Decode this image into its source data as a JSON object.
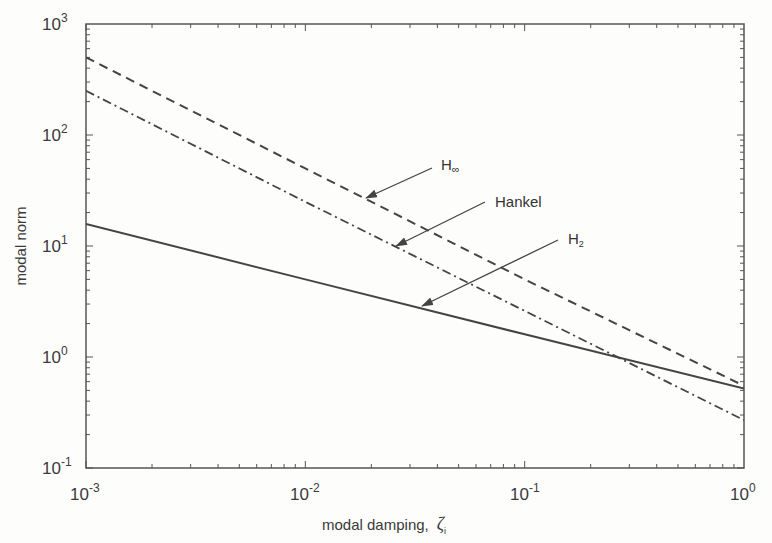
{
  "chart_data": {
    "type": "line",
    "title": "",
    "xlabel": "modal damping, ζ_i",
    "ylabel": "modal norm",
    "xscale": "log",
    "yscale": "log",
    "xlim": [
      0.001,
      1
    ],
    "ylim": [
      0.1,
      1000
    ],
    "grid": false,
    "x_ticks": [
      "10^-3",
      "10^-2",
      "10^-1",
      "10^0"
    ],
    "y_ticks": [
      "10^-1",
      "10^0",
      "10^1",
      "10^2",
      "10^3"
    ],
    "series": [
      {
        "name": "H∞",
        "style": "dashed",
        "x": [
          0.001,
          0.01,
          0.1,
          1
        ],
        "values": [
          500,
          50,
          5,
          0.55
        ]
      },
      {
        "name": "Hankel",
        "style": "dash-dot",
        "x": [
          0.001,
          0.01,
          0.1,
          1
        ],
        "values": [
          250,
          25,
          2.6,
          0.27
        ]
      },
      {
        "name": "H2",
        "style": "solid",
        "x": [
          0.001,
          0.01,
          0.1,
          1
        ],
        "values": [
          15.8,
          5.0,
          1.6,
          0.52
        ]
      }
    ],
    "annotations": [
      {
        "text": "H∞",
        "label_main": "H",
        "label_sub": "∞"
      },
      {
        "text": "Hankel"
      },
      {
        "text": "H2",
        "label_main": "H",
        "label_sub": "2"
      }
    ]
  },
  "axes": {
    "xlabel_main": "modal damping,",
    "xlabel_symbol": "ζ",
    "xlabel_sub": "i",
    "ylabel": "modal norm",
    "xticks": [
      {
        "base": "10",
        "exp": "-3"
      },
      {
        "base": "10",
        "exp": "-2"
      },
      {
        "base": "10",
        "exp": "-1"
      },
      {
        "base": "10",
        "exp": "0"
      }
    ],
    "yticks": [
      {
        "base": "10",
        "exp": "3"
      },
      {
        "base": "10",
        "exp": "2"
      },
      {
        "base": "10",
        "exp": "1"
      },
      {
        "base": "10",
        "exp": "0"
      },
      {
        "base": "10",
        "exp": "-1"
      }
    ]
  },
  "labels": {
    "hinf_main": "H",
    "hinf_sub": "∞",
    "hankel": "Hankel",
    "h2_main": "H",
    "h2_sub": "2"
  }
}
